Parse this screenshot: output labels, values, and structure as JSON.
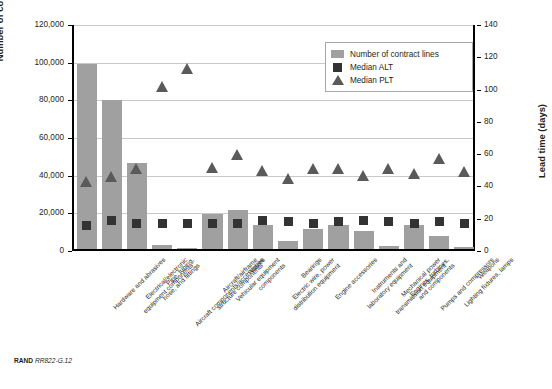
{
  "figure": {
    "source_note_bold": "RAND",
    "source_note_italic": "RR822-G.12"
  },
  "legend": {
    "items": [
      {
        "label": "Number of contract lines",
        "marker": "bar-swatch",
        "color": "#a0a0a0"
      },
      {
        "label": "Median ALT",
        "marker": "square-marker",
        "color": "#333333"
      },
      {
        "label": "Median PLT",
        "marker": "triangle-marker",
        "color": "#5a5a5a"
      }
    ]
  },
  "axes": {
    "left": {
      "title": "Number of contract lines",
      "ticks": [
        "0",
        "20,000",
        "40,000",
        "60,000",
        "80,000",
        "100,000",
        "120,000"
      ],
      "min": 0,
      "max": 120000,
      "step": 20000
    },
    "right": {
      "title": "Lead time (days)",
      "ticks": [
        "0",
        "20",
        "40",
        "60",
        "80",
        "100",
        "120",
        "140"
      ],
      "min": 0,
      "max": 140,
      "step": 20
    }
  },
  "chart_data": {
    "type": "bar",
    "title": "",
    "xlabel": "",
    "ylabel": "Number of contract lines",
    "y2label": "Lead time (days)",
    "ylim": [
      0,
      120000
    ],
    "y2lim": [
      0,
      140
    ],
    "grid": true,
    "legend_position": "top-right",
    "categories": [
      "Hardware and abrasives",
      "Electrical/electronic equipment components",
      "Pipe, tubing, hose, and fittings",
      "Aircraft components/accessories",
      "Aircraft/airframe structure components",
      "Vehicular equipment components",
      "Valves",
      "Electric wire, power distribution equipment",
      "Bearings",
      "Engine accessories",
      "Instruments and laboratory equipment",
      "Mechanical power transmission equipment",
      "Engines, turbines, and components",
      "Pumps and compressors",
      "Lighting fixtures, lamps",
      "Weapons"
    ],
    "series": [
      {
        "name": "Number of contract lines",
        "axis": "left",
        "type": "bar",
        "color": "#a0a0a0",
        "values": [
          98000,
          79000,
          45500,
          2000,
          500,
          18500,
          20500,
          13000,
          4000,
          10500,
          12500,
          9500,
          1500,
          13000,
          7000,
          1000
        ]
      },
      {
        "name": "Median ALT",
        "axis": "right",
        "type": "scatter",
        "color": "#333333",
        "values": [
          16,
          19,
          17,
          17,
          17,
          17,
          17,
          19,
          18,
          17,
          18,
          19,
          18,
          17,
          18,
          17
        ]
      },
      {
        "name": "Median PLT",
        "axis": "right",
        "type": "scatter",
        "color": "#5a5a5a",
        "values": [
          43,
          46,
          51,
          102,
          113,
          52,
          60,
          50,
          45,
          51,
          51,
          47,
          51,
          48,
          57,
          49
        ]
      }
    ]
  }
}
